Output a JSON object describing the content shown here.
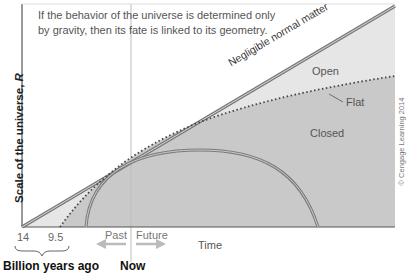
{
  "diagram": {
    "annotation": "If the behavior of the universe is determined only by gravity, then its fate is linked to its geometry.",
    "y_axis_label": "Scale of the universe,",
    "y_axis_symbol": "R",
    "x_axis_label": "Time",
    "regions": {
      "open": "Open",
      "flat": "Flat",
      "closed": "Closed"
    },
    "line_label": "Negligible normal matter",
    "ticks": [
      "14",
      "9.5"
    ],
    "ticks_group_label": "Billion years ago",
    "now_label": "Now",
    "past_label": "Past",
    "future_label": "Future",
    "credit": "© Cengage Learning 2014",
    "colors": {
      "open_fill": "#e6e6e6",
      "closed_fill": "#c9c9c9",
      "line": "#8a8a8a",
      "dotted": "#555555",
      "frame": "#555555"
    }
  }
}
